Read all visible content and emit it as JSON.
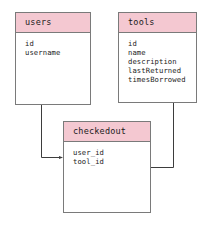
{
  "diagram": {
    "type": "entity-relationship-diagram",
    "background_color": "#ffffff",
    "header_color": "#f4c8d1",
    "border_color": "#7a7a7a",
    "text_color": "#1a1a1a",
    "entities": [
      {
        "id": "users",
        "title": "users",
        "fields": [
          "id",
          "username"
        ]
      },
      {
        "id": "tools",
        "title": "tools",
        "fields": [
          "id",
          "name",
          "description",
          "lastReturned",
          "timesBorrowed"
        ]
      },
      {
        "id": "checkedout",
        "title": "checkedout",
        "fields": [
          "user_id",
          "tool_id"
        ]
      }
    ],
    "relationships": [
      {
        "id": "users-to-checkedout",
        "from": "users",
        "to": "checkedout.user_id",
        "arrow_direction": "right"
      },
      {
        "id": "tools-to-checkedout",
        "from": "tools",
        "to": "checkedout.tool_id",
        "arrow_direction": "left"
      }
    ]
  }
}
